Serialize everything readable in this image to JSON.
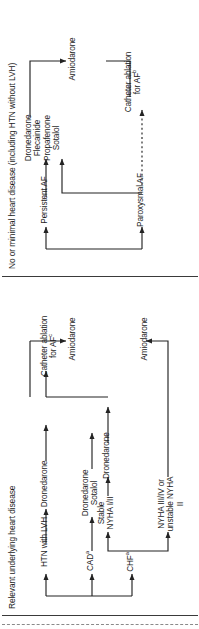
{
  "diagram": {
    "title_visible": false,
    "columns": [
      {
        "id": "no-or-minimal",
        "header": "No or minimal heart disease (including HTN without LVH)",
        "nodes": {
          "paroxysmal": "Paroxysmal AF",
          "persistent": "Persistent  AF",
          "drugs": "Dronedarone\nFlecainide\nPropafenone\nSotalol",
          "ablation_pre": "Catheter ablation",
          "ablation_post": "for AF",
          "ablation_sup": "b",
          "amiodarone": "Amiodarone"
        }
      },
      {
        "id": "relevant-underlying",
        "header": "Relevant underlying heart disease",
        "nodes": {
          "chf_pre": "CHF",
          "chf_sup": "a",
          "cad_pre": "CAD",
          "cad_sup": "a",
          "htn_lvh": "HTN with LVH",
          "stable_nyha": "Stable\nNYHA I/II",
          "unstable_nyha": "NYHA III/IV or\nunstable NYHA II",
          "dronedarone_chf": "Dronedarone",
          "dronedarone_sotalol": "Dronedarone\nSotalol",
          "dronedarone_htn": "Dronedarone",
          "ablation_pre": "Catheter ablation",
          "ablation_post": "for AF",
          "ablation_sup": "c",
          "amiodarone_top": "Amiodarone",
          "amiodarone_bottom": "Amiodarone"
        }
      }
    ],
    "colors": {
      "ink": "#1d1d1d",
      "line": "#2b2b2b",
      "divider": "#3a3a3a",
      "background": "#ffffff"
    }
  }
}
